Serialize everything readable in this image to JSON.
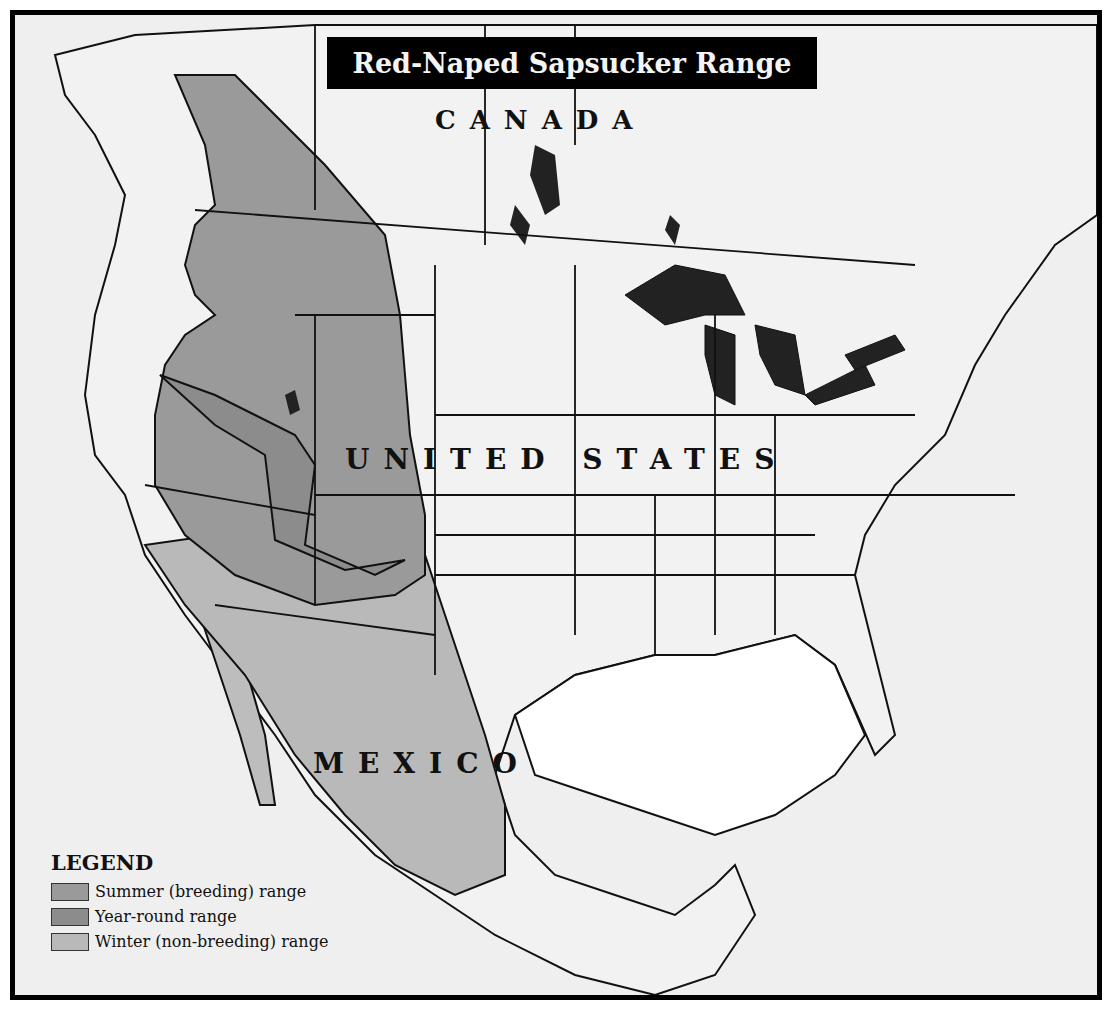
{
  "map": {
    "title": "Red-Naped Sapsucker Range",
    "labels": {
      "canada": "CANADA",
      "united_states": "UNITED STATES",
      "mexico": "MEXICO"
    },
    "colors": {
      "background": "#efefef",
      "summer": "#9a9a9a",
      "year_round": "#8c8c8c",
      "winter": "#b9b9b9",
      "lakes": "#222222",
      "borders": "#111111"
    }
  },
  "legend": {
    "title": "LEGEND",
    "items": [
      {
        "label": "Summer (breeding) range",
        "color": "#9a9a9a"
      },
      {
        "label": "Year-round range",
        "color": "#8c8c8c"
      },
      {
        "label": "Winter (non-breeding) range",
        "color": "#b9b9b9"
      }
    ]
  }
}
